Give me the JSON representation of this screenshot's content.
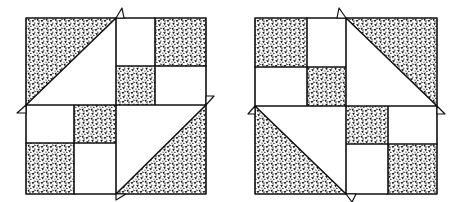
{
  "figure": {
    "description": "Two hand-drawn quilt block illustrations side by side",
    "colors": {
      "ink": "#111111",
      "paper": "#ffffff",
      "speckle": "#1a1a1a"
    },
    "blocks": [
      {
        "id": "block-left",
        "label": "Left quilt block",
        "x": 26,
        "y": 18,
        "w": 180,
        "h": 176,
        "quadrants": {
          "tl": {
            "type": "triangle",
            "shaded": "upper-left",
            "diagonal": "bl-tr"
          },
          "tr": {
            "type": "four-patch",
            "shaded": [
              "tr",
              "bl"
            ]
          },
          "bl": {
            "type": "four-patch",
            "shaded": [
              "tr",
              "bl"
            ]
          },
          "br": {
            "type": "triangle",
            "shaded": "lower-right",
            "diagonal": "bl-tr"
          }
        },
        "flags": [
          "top",
          "left",
          "right",
          "bottom"
        ]
      },
      {
        "id": "block-right",
        "label": "Right quilt block",
        "x": 255,
        "y": 18,
        "w": 182,
        "h": 176,
        "quadrants": {
          "tl": {
            "type": "four-patch",
            "shaded": [
              "tl",
              "br"
            ]
          },
          "tr": {
            "type": "triangle",
            "shaded": "upper-right",
            "diagonal": "tl-br"
          },
          "bl": {
            "type": "triangle",
            "shaded": "lower-left",
            "diagonal": "tl-br"
          },
          "br": {
            "type": "four-patch",
            "shaded": [
              "tl",
              "br"
            ]
          }
        },
        "flags": [
          "top",
          "left",
          "right",
          "bottom"
        ]
      }
    ]
  }
}
